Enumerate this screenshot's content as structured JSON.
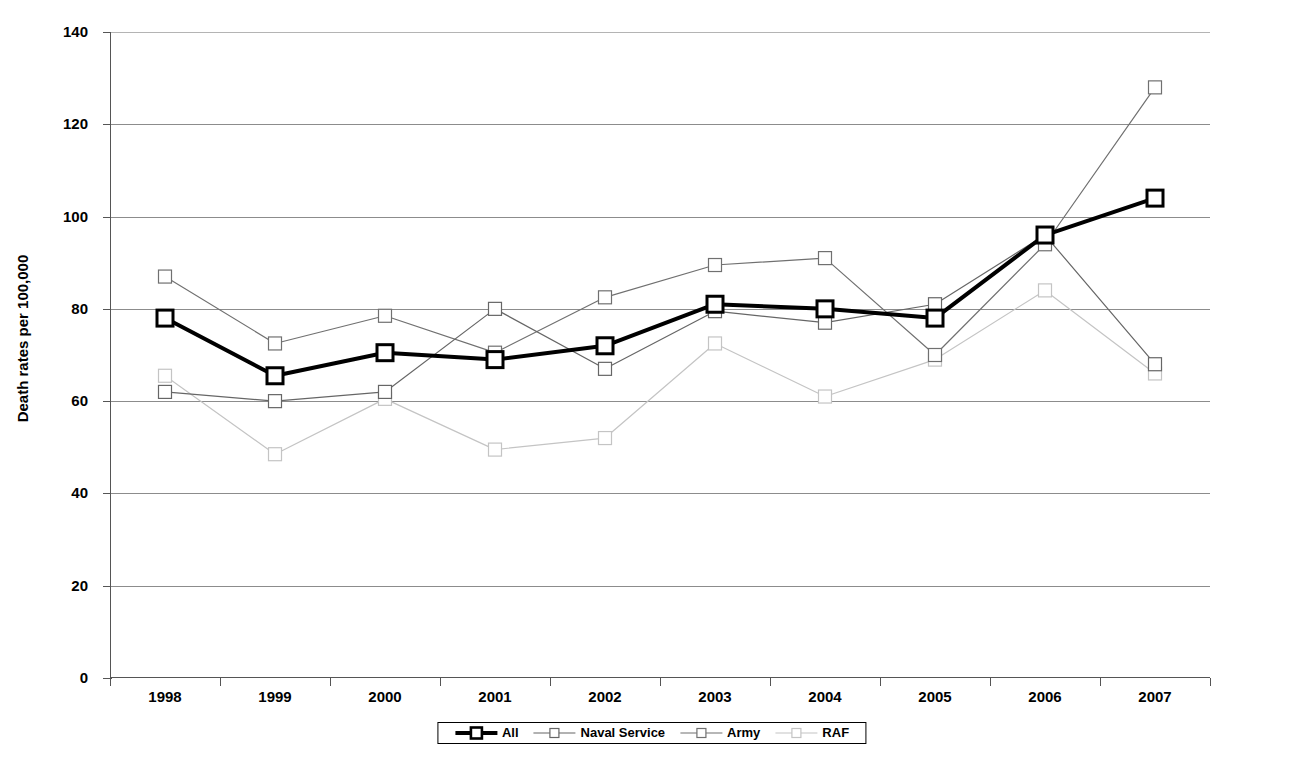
{
  "chart_data": {
    "type": "line",
    "title": "",
    "xlabel": "",
    "ylabel": "Death rates per 100,000",
    "categories": [
      "1998",
      "1999",
      "2000",
      "2001",
      "2002",
      "2003",
      "2004",
      "2005",
      "2006",
      "2007"
    ],
    "ylim": [
      0,
      140
    ],
    "ytick_step": 20,
    "yticks": [
      "140",
      "120",
      "100",
      "80",
      "60",
      "40",
      "20",
      "0"
    ],
    "grid": true,
    "legend_position": "bottom",
    "series": [
      {
        "name": "All",
        "color": "#000000",
        "line_width": 4,
        "marker": "square",
        "values": [
          78,
          65.5,
          70.5,
          69,
          72,
          81,
          80,
          78,
          96,
          104
        ]
      },
      {
        "name": "Naval Service",
        "color": "#666666",
        "line_width": 1.2,
        "marker": "square",
        "values": [
          62,
          60,
          62,
          80,
          67,
          79.5,
          77,
          81,
          96,
          68
        ]
      },
      {
        "name": "Army",
        "color": "#707070",
        "line_width": 1.2,
        "marker": "square",
        "values": [
          87,
          72.5,
          78.5,
          70.5,
          82.5,
          89.5,
          91,
          70,
          94,
          128
        ]
      },
      {
        "name": "RAF",
        "color": "#c4c4c4",
        "line_width": 1.2,
        "marker": "square",
        "values": [
          65.5,
          48.5,
          60.5,
          49.5,
          52,
          72.5,
          61,
          69,
          84,
          66
        ]
      }
    ]
  },
  "legend": {
    "items": [
      {
        "label": "All"
      },
      {
        "label": "Naval Service"
      },
      {
        "label": "Army"
      },
      {
        "label": "RAF"
      }
    ]
  }
}
